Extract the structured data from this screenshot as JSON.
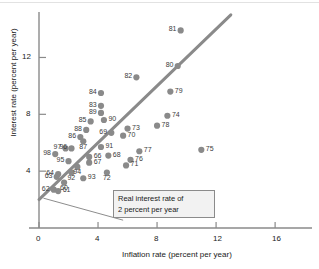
{
  "chart_data": {
    "type": "scatter",
    "title": "",
    "xlabel": "Inflation rate (percent per year)",
    "ylabel": "Interest rate (percent per year)",
    "xlim": [
      0,
      18.5
    ],
    "ylim": [
      0,
      15.2
    ],
    "xticks": [
      0,
      4,
      8,
      12,
      16
    ],
    "xticklabels": [
      "0",
      "4",
      "8",
      "12",
      "16"
    ],
    "yticks": [
      4,
      8,
      12
    ],
    "yticklabels": [
      "4",
      "8",
      "12"
    ],
    "grid": false,
    "legend": null,
    "point_color": "#8a8a8a",
    "line_color": "#8a8a8a",
    "axis_color": "#8a8a8a",
    "point_label_position": "varies",
    "points": [
      {
        "label": "81",
        "x": 9.6,
        "y": 13.9,
        "lp": "left"
      },
      {
        "label": "80",
        "x": 9.4,
        "y": 11.4,
        "lp": "left"
      },
      {
        "label": "82",
        "x": 6.6,
        "y": 10.6,
        "lp": "left"
      },
      {
        "label": "79",
        "x": 8.9,
        "y": 9.6,
        "lp": "right"
      },
      {
        "label": "84",
        "x": 4.2,
        "y": 9.5,
        "lp": "left"
      },
      {
        "label": "83",
        "x": 4.2,
        "y": 8.6,
        "lp": "left"
      },
      {
        "label": "89",
        "x": 4.2,
        "y": 8.1,
        "lp": "left"
      },
      {
        "label": "74",
        "x": 8.7,
        "y": 7.9,
        "lp": "right"
      },
      {
        "label": "90",
        "x": 4.4,
        "y": 7.6,
        "lp": "right"
      },
      {
        "label": "85",
        "x": 3.5,
        "y": 7.5,
        "lp": "left"
      },
      {
        "label": "78",
        "x": 8.0,
        "y": 7.2,
        "lp": "right"
      },
      {
        "label": "73",
        "x": 6.0,
        "y": 7.0,
        "lp": "right"
      },
      {
        "label": "88",
        "x": 3.2,
        "y": 6.9,
        "lp": "left"
      },
      {
        "label": "69",
        "x": 4.9,
        "y": 6.7,
        "lp": "left"
      },
      {
        "label": "70",
        "x": 5.7,
        "y": 6.5,
        "lp": "right"
      },
      {
        "label": "86",
        "x": 2.8,
        "y": 6.4,
        "lp": "left"
      },
      {
        "label": "87",
        "x": 3.0,
        "y": 6.1,
        "lp": "below"
      },
      {
        "label": "91",
        "x": 4.2,
        "y": 5.7,
        "lp": "right"
      },
      {
        "label": "97",
        "x": 1.8,
        "y": 5.6,
        "lp": "left"
      },
      {
        "label": "96",
        "x": 2.2,
        "y": 5.6,
        "lp": "left"
      },
      {
        "label": "75",
        "x": 11.0,
        "y": 5.5,
        "lp": "right"
      },
      {
        "label": "77",
        "x": 6.8,
        "y": 5.4,
        "lp": "right"
      },
      {
        "label": "98",
        "x": 1.1,
        "y": 5.2,
        "lp": "left"
      },
      {
        "label": "68",
        "x": 4.7,
        "y": 5.1,
        "lp": "right"
      },
      {
        "label": "66",
        "x": 3.4,
        "y": 5.0,
        "lp": "right"
      },
      {
        "label": "76",
        "x": 6.2,
        "y": 4.8,
        "lp": "right"
      },
      {
        "label": "95",
        "x": 2.0,
        "y": 4.7,
        "lp": "left"
      },
      {
        "label": "67",
        "x": 3.4,
        "y": 4.6,
        "lp": "right"
      },
      {
        "label": "71",
        "x": 5.9,
        "y": 4.4,
        "lp": "right"
      },
      {
        "label": "94",
        "x": 2.6,
        "y": 4.3,
        "lp": "below"
      },
      {
        "label": "92",
        "x": 2.2,
        "y": 3.9,
        "lp": "below"
      },
      {
        "label": "72",
        "x": 4.6,
        "y": 3.9,
        "lp": "below"
      },
      {
        "label": "64",
        "x": 1.3,
        "y": 3.8,
        "lp": "left"
      },
      {
        "label": "63",
        "x": 1.2,
        "y": 3.6,
        "lp": "left"
      },
      {
        "label": "93",
        "x": 3.0,
        "y": 3.5,
        "lp": "right"
      },
      {
        "label": "60",
        "x": 1.7,
        "y": 3.2,
        "lp": "below"
      },
      {
        "label": "62",
        "x": 1.0,
        "y": 2.7,
        "lp": "left"
      },
      {
        "label": "61",
        "x": 1.3,
        "y": 2.6,
        "lp": "right"
      }
    ],
    "trend_line": {
      "note": "Real interest rate of 2 percent per year",
      "x0": 0.0,
      "y0": 2.0,
      "x1": 13.0,
      "y1": 15.0
    },
    "annotation": {
      "line1": "Real interest rate of",
      "line2": "2 percent per year",
      "leader_from": {
        "x": 5.7,
        "y": 0.55
      },
      "leader_to": {
        "x": 0.3,
        "y": 2.1
      }
    }
  }
}
